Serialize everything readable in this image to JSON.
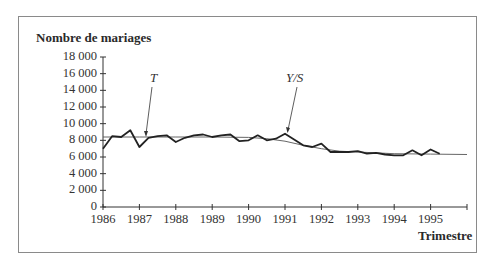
{
  "chart_data": {
    "type": "line",
    "title": "",
    "ylabel": "Nombre de mariages",
    "xlabel": "Trimestre",
    "ylim": [
      0,
      18000
    ],
    "yticks": [
      "18 000",
      "16 000",
      "14 000",
      "12 000",
      "10 000",
      "8 000",
      "6 000",
      "4 000",
      "2 000",
      "0"
    ],
    "xticks": [
      "1986",
      "1987",
      "1988",
      "1989",
      "1990",
      "1991",
      "1992",
      "1993",
      "1994",
      "1995"
    ],
    "xlim": [
      1986,
      1996
    ],
    "grid": false,
    "legend": "none",
    "annotations": [
      {
        "label": "T",
        "points_to": "trend line near 1987"
      },
      {
        "label": "Y/S",
        "points_to": "seasonally adjusted series near 1991"
      }
    ],
    "series": [
      {
        "name": "Y/S",
        "style": "thick",
        "x": [
          1986.0,
          1986.25,
          1986.5,
          1986.75,
          1987.0,
          1987.25,
          1987.5,
          1987.75,
          1988.0,
          1988.25,
          1988.5,
          1988.75,
          1989.0,
          1989.25,
          1989.5,
          1989.75,
          1990.0,
          1990.25,
          1990.5,
          1990.75,
          1991.0,
          1991.25,
          1991.5,
          1991.75,
          1992.0,
          1992.25,
          1992.5,
          1992.75,
          1993.0,
          1993.25,
          1993.5,
          1993.75,
          1994.0,
          1994.25,
          1994.5,
          1994.75,
          1995.0,
          1995.25
        ],
        "values": [
          7000,
          8500,
          8400,
          9200,
          7200,
          8300,
          8500,
          8600,
          7800,
          8300,
          8600,
          8700,
          8400,
          8600,
          8700,
          7900,
          8000,
          8600,
          8000,
          8200,
          8800,
          8100,
          7400,
          7200,
          7600,
          6600,
          6600,
          6600,
          6700,
          6400,
          6500,
          6300,
          6200,
          6200,
          6800,
          6200,
          6900,
          6400
        ]
      },
      {
        "name": "T",
        "style": "thin",
        "x": [
          1986.0,
          1987.0,
          1988.0,
          1989.0,
          1990.0,
          1990.5,
          1991.0,
          1991.5,
          1992.0,
          1992.5,
          1993.0,
          1994.0,
          1995.0,
          1996.0
        ],
        "values": [
          8400,
          8400,
          8400,
          8400,
          8350,
          8200,
          7900,
          7400,
          7000,
          6700,
          6600,
          6400,
          6350,
          6300
        ]
      }
    ]
  }
}
